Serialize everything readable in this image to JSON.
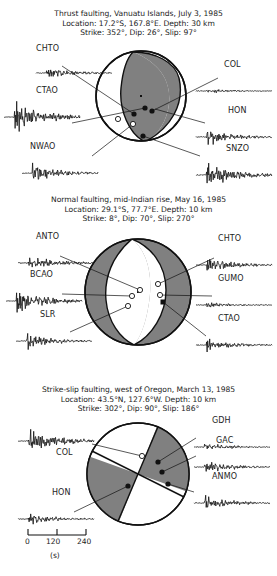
{
  "figure": {
    "kind": "focal-mechanism-seismogram-figure",
    "grey_fill": "#808080",
    "line_color": "#111111"
  },
  "panels": [
    {
      "id": "thrust",
      "title": "Thrust faulting, Vanuatu Islands, July 3, 1985",
      "location": "Location: 17.2°S, 167.8°E. Depth: 30 km",
      "mechanism": "Strike: 352°, Dip: 26°, Slip: 97°",
      "strike": 352,
      "dip": 26,
      "slip": 97,
      "depth_km": 30,
      "lat": "17.2°S",
      "lon": "167.8°E",
      "date": "July 3, 1985",
      "fault_type": "thrust",
      "stations": [
        {
          "code": "CHTO",
          "side": "left",
          "amp": 0.4,
          "spike": 0.55,
          "seed": 11
        },
        {
          "code": "CTAO",
          "side": "left",
          "amp": 1.0,
          "spike": 1.0,
          "seed": 23
        },
        {
          "code": "NWAO",
          "side": "left",
          "amp": 0.6,
          "spike": 0.45,
          "seed": 37
        },
        {
          "code": "COL",
          "side": "right",
          "amp": 0.18,
          "spike": 0.3,
          "seed": 41
        },
        {
          "code": "HON",
          "side": "right",
          "amp": 0.52,
          "spike": 0.6,
          "seed": 53
        },
        {
          "code": "SNZO",
          "side": "right",
          "amp": 0.8,
          "spike": 0.75,
          "seed": 67
        }
      ]
    },
    {
      "id": "normal",
      "title": "Normal faulting, mid-Indian rise, May 16, 1985",
      "location": "Location: 29.1°S, 77.7°E. Depth: 10 km",
      "mechanism": "Strike: 8°, Dip: 70°, Slip: 270°",
      "strike": 8,
      "dip": 70,
      "slip": 270,
      "depth_km": 10,
      "lat": "29.1°S",
      "lon": "77.7°E",
      "date": "May 16, 1985",
      "fault_type": "normal",
      "stations": [
        {
          "code": "ANTO",
          "side": "left",
          "amp": 0.45,
          "spike": 0.62,
          "seed": 71
        },
        {
          "code": "BCAO",
          "side": "left",
          "amp": 0.72,
          "spike": 0.85,
          "seed": 83
        },
        {
          "code": "SLR",
          "side": "left",
          "amp": 0.5,
          "spike": 0.7,
          "seed": 97
        },
        {
          "code": "CHTO",
          "side": "right",
          "amp": 0.46,
          "spike": 0.68,
          "seed": 103
        },
        {
          "code": "GUMO",
          "side": "right",
          "amp": 0.2,
          "spike": 0.22,
          "seed": 113
        },
        {
          "code": "CTAO",
          "side": "right",
          "amp": 0.42,
          "spike": 0.6,
          "seed": 127
        }
      ]
    },
    {
      "id": "strike-slip",
      "title": "Strike-slip faulting, west of Oregon, March 13, 1985",
      "location": "Location: 43.5°N, 127.6°W. Depth: 10 km",
      "mechanism": "Strike: 302°, Dip: 90°, Slip: 186°",
      "strike": 302,
      "dip": 90,
      "slip": 186,
      "depth_km": 10,
      "lat": "43.5°N",
      "lon": "127.6°W",
      "date": "March 13, 1985",
      "fault_type": "strike-slip",
      "stations": [
        {
          "code": "COL",
          "side": "left",
          "amp": 0.85,
          "spike": 0.55,
          "seed": 131
        },
        {
          "code": "HON",
          "side": "left",
          "amp": 0.38,
          "spike": 0.4,
          "seed": 149
        },
        {
          "code": "GDH",
          "side": "right",
          "amp": 0.26,
          "spike": 0.2,
          "seed": 157
        },
        {
          "code": "GAC",
          "side": "right",
          "amp": 0.4,
          "spike": 0.25,
          "seed": 167
        },
        {
          "code": "ANMO",
          "side": "right",
          "amp": 0.45,
          "spike": 0.8,
          "seed": 179
        }
      ]
    }
  ],
  "scale": {
    "ticks": [
      "0",
      "120",
      "240"
    ],
    "unit": "(s)"
  }
}
